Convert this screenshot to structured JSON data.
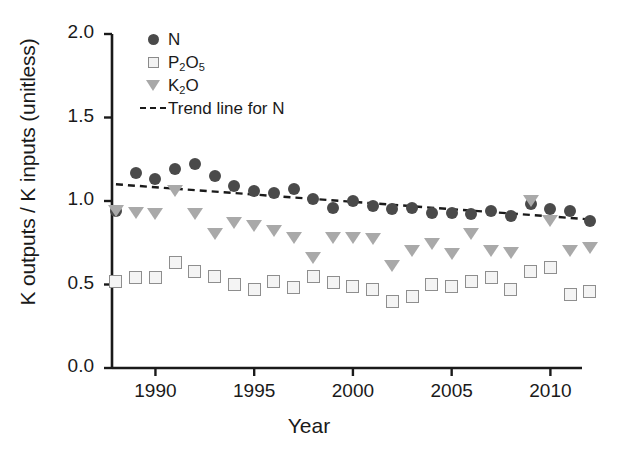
{
  "chart_data": {
    "type": "scatter",
    "title": "",
    "xlabel": "Year",
    "ylabel": "K outputs / K inputs (unitless)",
    "xlim": [
      1987.8,
      1991.6
    ],
    "ylim": [
      0.0,
      2.0
    ],
    "grid": false,
    "legend_position": "top-left",
    "xticks": [
      "1990",
      "1995",
      "2000",
      "2005",
      "2010"
    ],
    "xtick_values": [
      1990,
      1995,
      2000,
      2005,
      2010
    ],
    "yticks": [
      "0.0",
      "0.5",
      "1.0",
      "1.5",
      "2.0"
    ],
    "ytick_values": [
      0.0,
      0.5,
      1.0,
      1.5,
      2.0
    ],
    "x": [
      1988,
      1989,
      1990,
      1991,
      1992,
      1993,
      1994,
      1995,
      1996,
      1997,
      1998,
      1999,
      2000,
      2001,
      2002,
      2003,
      2004,
      2005,
      2006,
      2007,
      2008,
      2009,
      2010,
      2011,
      2012
    ],
    "series": [
      {
        "name": "N",
        "marker": "filled-circle",
        "color": "#4a4a4a",
        "values": [
          0.94,
          1.17,
          1.13,
          1.19,
          1.22,
          1.15,
          1.09,
          1.06,
          1.05,
          1.07,
          1.01,
          0.96,
          1.0,
          0.97,
          0.95,
          0.96,
          0.93,
          0.93,
          0.92,
          0.94,
          0.91,
          0.98,
          0.95,
          0.94,
          0.88
        ]
      },
      {
        "name": "P2O5",
        "marker": "open-square",
        "color": "#8e8e8e",
        "values": [
          0.52,
          0.54,
          0.54,
          0.63,
          0.58,
          0.55,
          0.5,
          0.47,
          0.52,
          0.48,
          0.55,
          0.51,
          0.49,
          0.47,
          0.4,
          0.43,
          0.5,
          0.49,
          0.52,
          0.54,
          0.47,
          0.58,
          0.6,
          0.44,
          0.46
        ]
      },
      {
        "name": "K2O",
        "marker": "filled-triangle-down",
        "color": "#a9a9a9",
        "values": [
          0.94,
          0.93,
          0.92,
          1.06,
          0.92,
          0.8,
          0.87,
          0.85,
          0.82,
          0.78,
          0.66,
          0.78,
          0.78,
          0.77,
          0.61,
          0.7,
          0.74,
          0.68,
          0.8,
          0.7,
          0.69,
          1.0,
          0.88,
          0.7,
          0.72
        ]
      }
    ],
    "trend_lines": [
      {
        "name": "Trend line for N",
        "style": "dashed",
        "color": "#1a1a1a",
        "x_start": 1988,
        "y_start": 1.1,
        "x_end": 2012,
        "y_end": 0.89
      }
    ]
  },
  "axis": {
    "ylabel": "K outputs / K inputs (unitless)",
    "xlabel": "Year"
  },
  "legend": {
    "items": [
      {
        "label": "N",
        "sub": "",
        "tail": "",
        "marker": "filled-circle"
      },
      {
        "label": "P",
        "sub": "2",
        "tail2": "O",
        "sub2": "5",
        "marker": "open-square"
      },
      {
        "label": "K",
        "sub": "2",
        "tail2": "O",
        "sub2": "",
        "marker": "filled-triangle-down"
      },
      {
        "label": "Trend line for N",
        "marker": "dashed-line"
      }
    ],
    "n_label": "N",
    "p2o5_label": "P2O5",
    "k2o_label": "K2O",
    "trend_label": "Trend line for N"
  }
}
